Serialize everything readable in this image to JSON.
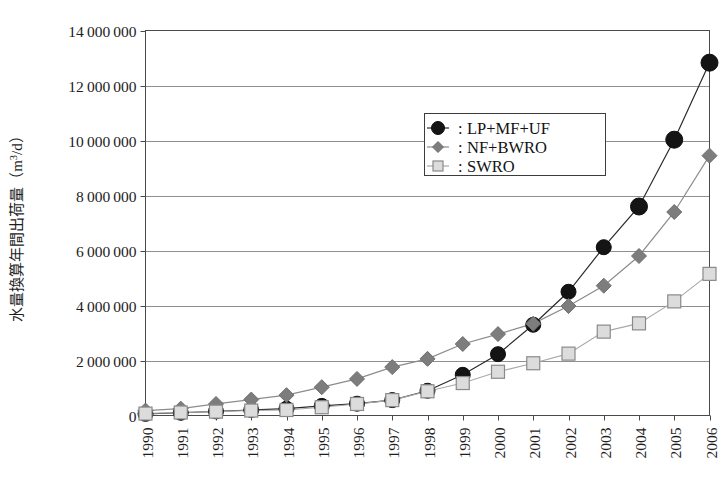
{
  "chart_data": {
    "type": "line",
    "title": "",
    "xlabel": "",
    "ylabel": "水量換算年間出荷量（m³/d）",
    "ylabel_parts": {
      "main": "水量換算年間出荷量（m",
      "sup": "3",
      "tail": "/d）"
    },
    "categories": [
      "1990",
      "1991",
      "1992",
      "1993",
      "1994",
      "1995",
      "1996",
      "1997",
      "1998",
      "1999",
      "2000",
      "2001",
      "2002",
      "2003",
      "2004",
      "2005",
      "2006"
    ],
    "x": [
      1990,
      1991,
      1992,
      1993,
      1994,
      1995,
      1996,
      1997,
      1998,
      1999,
      2000,
      2001,
      2002,
      2003,
      2004,
      2005,
      2006
    ],
    "ylim": [
      0,
      14000000
    ],
    "xlim": [
      1990,
      2006
    ],
    "ytick_values": [
      0,
      2000000,
      4000000,
      6000000,
      8000000,
      10000000,
      12000000,
      14000000
    ],
    "ytick_labels": [
      "0",
      "2 000 000",
      "4 000 000",
      "6 000 000",
      "8 000 000",
      "10 000 000",
      "12 000 000",
      "14 000 000"
    ],
    "grid": {
      "horizontal": true,
      "vertical": false
    },
    "legend_position": "upper-center",
    "series": [
      {
        "name": "LP+MF+UF",
        "marker": "circle",
        "color": "#141414",
        "line_color": "#2a2a2a",
        "values": [
          60000,
          100000,
          150000,
          200000,
          250000,
          350000,
          430000,
          560000,
          900000,
          1480000,
          2230000,
          3300000,
          4500000,
          6120000,
          7600000,
          10030000,
          12830000
        ]
      },
      {
        "name": "NF+BWRO",
        "marker": "diamond",
        "color": "#7d7d7d",
        "line_color": "#8c8c8c",
        "values": [
          180000,
          250000,
          420000,
          580000,
          740000,
          1030000,
          1330000,
          1760000,
          2060000,
          2600000,
          2960000,
          3340000,
          3980000,
          4720000,
          5800000,
          7400000,
          9450000
        ]
      },
      {
        "name": "SWRO",
        "marker": "square",
        "color": "#dcdcdc",
        "line_color": "#a9a9a9",
        "values": [
          70000,
          110000,
          140000,
          180000,
          200000,
          300000,
          420000,
          560000,
          880000,
          1180000,
          1590000,
          1900000,
          2250000,
          3050000,
          3350000,
          4150000,
          5150000
        ]
      }
    ]
  },
  "legend": {
    "colon": "：",
    "entries": [
      {
        "label": "LP+MF+UF"
      },
      {
        "label": "NF+BWRO"
      },
      {
        "label": "SWRO"
      }
    ]
  },
  "colors": {
    "plot_border": "#4a4a4a",
    "gridline": "#8f8f8f",
    "background": "#ffffff",
    "series_black": "#141414",
    "series_gray": "#7d7d7d",
    "series_light": "#dcdcdc"
  }
}
